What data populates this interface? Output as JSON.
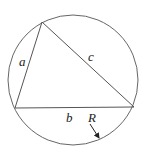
{
  "diagram": {
    "type": "circumscribed-triangle",
    "labels": {
      "side_a": "a",
      "side_b": "b",
      "side_c": "c",
      "radius": "R"
    },
    "colors": {
      "stroke": "#555555",
      "text": "#222222",
      "background": "#ffffff"
    }
  }
}
